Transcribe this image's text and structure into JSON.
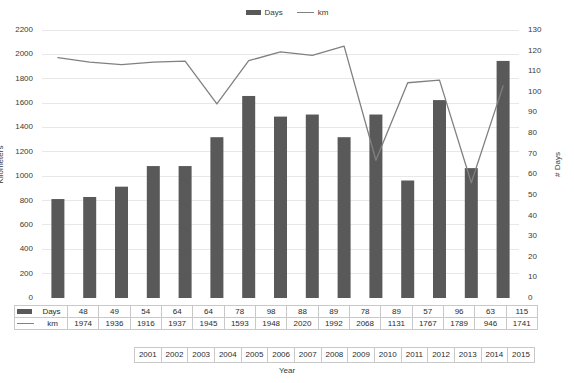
{
  "legend": {
    "bar_label": "Days",
    "line_label": "km",
    "bar_marker": "bar-swatch-icon",
    "line_marker": "line-swatch-icon"
  },
  "axes": {
    "left_title": "Kilometers",
    "right_title": "# Days",
    "x_title": "Year",
    "left_ticks": [
      "2200",
      "2000",
      "1800",
      "1600",
      "1400",
      "1200",
      "1000",
      "800",
      "600",
      "400",
      "200",
      "0"
    ],
    "right_ticks": [
      "130",
      "120",
      "110",
      "100",
      "90",
      "80",
      "70",
      "60",
      "50",
      "40",
      "30",
      "20",
      "10",
      "0"
    ]
  },
  "colors": {
    "bar": "#595959",
    "line": "#808080",
    "grid": "#e8e8e8",
    "axis_text": "#3a3a3a",
    "table_border": "#c9c9c9"
  },
  "table": {
    "row_days_label": "Days",
    "row_km_label": "km"
  },
  "chart_data": {
    "type": "bar",
    "title": "",
    "subtitle": "",
    "xlabel": "Year",
    "ylabel": "Kilometers",
    "y2label": "# Days",
    "grid": true,
    "legend_position": "top-center",
    "ylim": [
      0,
      2200
    ],
    "y2lim": [
      0,
      130
    ],
    "ytick_step": 200,
    "y2tick_step": 10,
    "categories": [
      "2001",
      "2002",
      "2003",
      "2004",
      "2005",
      "2006",
      "2007",
      "2008",
      "2009",
      "2010",
      "2011",
      "2012",
      "2013",
      "2014",
      "2015"
    ],
    "series": [
      {
        "name": "Days",
        "type": "bar",
        "axis": "right",
        "unit": "days",
        "values": [
          48,
          49,
          54,
          64,
          64,
          78,
          98,
          88,
          89,
          78,
          89,
          57,
          96,
          63,
          115
        ]
      },
      {
        "name": "km",
        "type": "line",
        "axis": "left",
        "unit": "kilometers",
        "values": [
          1974,
          1936,
          1916,
          1937,
          1945,
          1593,
          1948,
          2020,
          1992,
          2068,
          1131,
          1767,
          1789,
          946,
          1741
        ]
      }
    ]
  }
}
